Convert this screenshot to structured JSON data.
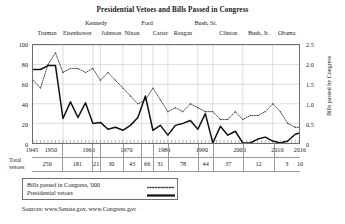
{
  "chart_data": {
    "type": "line",
    "title": "Presidential Vetoes and Bills Passed in Congress",
    "xlabel": "",
    "ylabel": "Presidential vetoes",
    "y2label": "Bills passed by Congress",
    "xlim": [
      1945,
      2016
    ],
    "ylim": [
      0,
      100
    ],
    "y2lim": [
      0,
      2.5
    ],
    "grid": true,
    "legend_position": "below-left",
    "xticks": [
      "1945",
      "1950",
      "1960",
      "1970",
      "1980",
      "1990",
      "2000",
      "2010",
      "2016"
    ],
    "xtick_values": [
      1945,
      1950,
      1960,
      1970,
      1980,
      1990,
      2000,
      2010,
      2016
    ],
    "yticks_left": [
      "0",
      "20",
      "40",
      "60",
      "80",
      "100"
    ],
    "ytick_left_values": [
      0,
      20,
      40,
      60,
      80,
      100
    ],
    "yticks_right": [
      "0",
      "0.5",
      "1.0",
      "1.5",
      "2.0",
      "2.5"
    ],
    "ytick_right_values": [
      0,
      0.5,
      1.0,
      1.5,
      2.0,
      2.5
    ],
    "series": [
      {
        "name": "Bills passed in Congress, '000",
        "axis": "right",
        "style": "dotted",
        "x": [
          1945,
          1947,
          1949,
          1951,
          1953,
          1955,
          1957,
          1959,
          1961,
          1963,
          1965,
          1967,
          1969,
          1971,
          1973,
          1975,
          1977,
          1979,
          1981,
          1983,
          1985,
          1987,
          1989,
          1991,
          1993,
          1995,
          1997,
          1999,
          2001,
          2003,
          2005,
          2007,
          2009,
          2011,
          2013,
          2015,
          2016
        ],
        "values": [
          1.6,
          1.4,
          2.0,
          2.3,
          1.8,
          1.9,
          1.9,
          1.8,
          1.9,
          1.6,
          1.8,
          1.6,
          1.4,
          1.2,
          1.0,
          1.1,
          1.4,
          1.1,
          0.8,
          0.9,
          0.8,
          1.0,
          0.9,
          0.8,
          0.8,
          0.6,
          0.6,
          0.8,
          0.6,
          0.7,
          0.7,
          0.8,
          1.0,
          0.8,
          0.5,
          0.4,
          0.4
        ]
      },
      {
        "name": "Presidential vetoes",
        "axis": "left",
        "style": "solid",
        "x": [
          1945,
          1947,
          1949,
          1951,
          1953,
          1955,
          1957,
          1959,
          1961,
          1963,
          1965,
          1967,
          1969,
          1971,
          1973,
          1975,
          1977,
          1979,
          1981,
          1983,
          1985,
          1987,
          1989,
          1991,
          1993,
          1995,
          1997,
          1999,
          2001,
          2003,
          2005,
          2007,
          2009,
          2011,
          2013,
          2015,
          2016
        ],
        "values": [
          75,
          75,
          79,
          79,
          25,
          42,
          26,
          41,
          20,
          21,
          14,
          16,
          13,
          18,
          26,
          48,
          13,
          18,
          8,
          18,
          20,
          23,
          14,
          30,
          0,
          17,
          8,
          12,
          0,
          0,
          4,
          6,
          2,
          0,
          2,
          9,
          10
        ]
      }
    ],
    "presidents": [
      {
        "name": "Truman",
        "start": 1945,
        "end": 1953,
        "row": 1,
        "total_vetoes": "250"
      },
      {
        "name": "Eisenhower",
        "start": 1953,
        "end": 1961,
        "row": 1,
        "total_vetoes": "181"
      },
      {
        "name": "Kennedy",
        "start": 1961,
        "end": 1963,
        "row": 0,
        "total_vetoes": "21"
      },
      {
        "name": "Johnson",
        "start": 1963,
        "end": 1969,
        "row": 1,
        "total_vetoes": "30"
      },
      {
        "name": "Nixon",
        "start": 1969,
        "end": 1974,
        "row": 1,
        "total_vetoes": "43"
      },
      {
        "name": "Ford",
        "start": 1974,
        "end": 1977,
        "row": 0,
        "total_vetoes": "66"
      },
      {
        "name": "Carter",
        "start": 1977,
        "end": 1981,
        "row": 1,
        "total_vetoes": "31"
      },
      {
        "name": "Reagan",
        "start": 1981,
        "end": 1989,
        "row": 1,
        "total_vetoes": "78"
      },
      {
        "name": "Bush, Sr.",
        "start": 1989,
        "end": 1993,
        "row": 0,
        "total_vetoes": "44"
      },
      {
        "name": "Clinton",
        "start": 1993,
        "end": 2001,
        "row": 1,
        "total_vetoes": "37"
      },
      {
        "name": "Bush, Jr.",
        "start": 2001,
        "end": 2009,
        "row": 1,
        "total_vetoes": "12"
      },
      {
        "name": "Obama",
        "start": 2009,
        "end": 2016,
        "row": 1,
        "total_vetoes": "3"
      }
    ]
  },
  "totals_row": {
    "label_line1": "Total",
    "label_line2": "vetoes",
    "extra_value": "10"
  },
  "legend": {
    "items": [
      {
        "label": "Bills passed in Congress, '000",
        "style": "dotted"
      },
      {
        "label": "Presidential vetoes",
        "style": "solid"
      }
    ]
  },
  "source": {
    "text": "Sources: www.Senate.gov, www.Congress.gov"
  }
}
